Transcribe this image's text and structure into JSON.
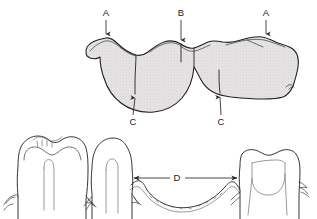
{
  "figure": {
    "background_color": "#ffffff",
    "line_color": "#231f20",
    "fill_color": "#e3e1e2",
    "label_color": "#1a1a1a"
  },
  "labels": [
    {
      "id": "label-a-left",
      "text": "A",
      "x": 106,
      "y": 13,
      "leader_from": [
        106,
        20
      ],
      "leader_to": [
        106,
        38
      ],
      "points_to": "buccal-cusp-ridge-left",
      "description": "Marginal ridge / cusp tip of left molar, occlusal view"
    },
    {
      "id": "label-b",
      "text": "B",
      "x": 181,
      "y": 13,
      "leader_from": [
        181,
        20
      ],
      "leader_to": [
        181,
        44
      ],
      "points_to": "interproximal-contact-area",
      "description": "Contact area between adjacent teeth, occlusal view"
    },
    {
      "id": "label-a-right",
      "text": "A",
      "x": 266,
      "y": 13,
      "leader_from": [
        266,
        20
      ],
      "leader_to": [
        266,
        38
      ],
      "points_to": "buccal-cusp-ridge-right",
      "description": "Marginal ridge / cusp tip of right molar, occlusal view"
    },
    {
      "id": "label-c-left",
      "text": "C",
      "x": 133,
      "y": 122,
      "leader_from": [
        133,
        115
      ],
      "leader_to": [
        135,
        94
      ],
      "points_to": "lingual-embrasure-left",
      "description": "Lingual embrasure / interproximal space, occlusal view"
    },
    {
      "id": "label-c-right",
      "text": "C",
      "x": 221,
      "y": 122,
      "leader_from": [
        221,
        115
      ],
      "leader_to": [
        220,
        93
      ],
      "points_to": "lingual-embrasure-right",
      "description": "Lingual embrasure / interproximal space, occlusal view"
    },
    {
      "id": "label-d",
      "text": "D",
      "x": 177,
      "y": 178,
      "leader_from": [
        168,
        178
      ],
      "leader_to": [
        131,
        178
      ],
      "leader_from_2": [
        187,
        178
      ],
      "leader_to_2": [
        240,
        178
      ],
      "points_to": "edentulous-span",
      "description": "Edentulous span / interdental distance between roots, proximal view"
    }
  ],
  "legend_items": [
    {
      "key": "A",
      "meaning": "Marginal ridge / cusp"
    },
    {
      "key": "B",
      "meaning": "Contact area"
    },
    {
      "key": "C",
      "meaning": "Embrasure"
    },
    {
      "key": "D",
      "meaning": "Edentulous span"
    }
  ],
  "figures": {
    "upper": {
      "name": "occlusal-view",
      "description": "Occlusal (top-down) view of three adjacent posterior teeth, stippled shading"
    },
    "lower": {
      "name": "proximal-view",
      "description": "Proximal (side) view showing crowns, roots, and alveolar bone crest curve"
    }
  }
}
